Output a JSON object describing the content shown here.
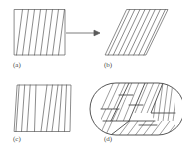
{
  "figure": {
    "type": "scientific-diagram",
    "background_color": "#ffffff",
    "stroke_color": "#555555",
    "label_color": "#4a4a4a",
    "width": 182,
    "height": 154,
    "caption_style": "lowercase-parenthesized"
  },
  "panels": [
    {
      "id": "a",
      "label": "(a)",
      "name": "undeformed-lamellar-block",
      "shape": "rectangle",
      "description": "Rectangular block with near-vertical steeply inclined lamellae",
      "stripe_count": 8,
      "stripe_angle_deg": 10,
      "box": {
        "x": 0,
        "y": 0,
        "w": 52,
        "h": 48
      }
    },
    {
      "id": "b",
      "label": "(b)",
      "name": "sheared-parallelogram-block",
      "shape": "parallelogram",
      "description": "Simple-shear deformed parallelogram with inclined lamellae",
      "stripe_count": 8,
      "stripe_angle_deg": 38,
      "shear_offset": 22,
      "box": {
        "x": 0,
        "y": 0,
        "w": 62,
        "h": 48
      }
    },
    {
      "id": "c",
      "label": "(c)",
      "name": "rotated-lamellae-block",
      "shape": "quadrilateral",
      "description": "Quadrilateral block with lamellae of mixed inclination forming a fan / twist",
      "stripe_count": 9,
      "box": {
        "x": 0,
        "y": 0,
        "w": 58,
        "h": 48
      }
    },
    {
      "id": "d",
      "label": "(d)",
      "name": "rounded-domain-jigsaw-block",
      "shape": "rounded-rectangle",
      "description": "Rounded rectangular domain subdivided into interlocking regions, each hatched at a different orientation",
      "region_count": 6,
      "box": {
        "x": 0,
        "y": 0,
        "w": 74,
        "h": 52
      }
    }
  ],
  "annotations": [
    {
      "name": "transform-arrow",
      "type": "arrow",
      "direction": "right",
      "from_panel": "a",
      "to_panel": "b",
      "length": 30
    }
  ]
}
